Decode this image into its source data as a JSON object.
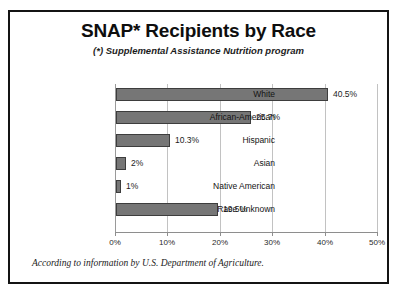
{
  "chart_data": {
    "type": "bar",
    "orientation": "horizontal",
    "title": "SNAP* Recipients by Race",
    "subtitle": "(*) Supplemental Assistance Nutrition program",
    "xlabel": "",
    "ylabel": "",
    "xlim": [
      0,
      50
    ],
    "grid": true,
    "legend": null,
    "categories": [
      "White",
      "African-American",
      "Hispanic",
      "Asian",
      "Native American",
      "Race Unknown"
    ],
    "values": [
      40.5,
      25.7,
      10.3,
      2,
      1,
      19.5
    ],
    "data_labels": [
      "40.5%",
      "25.7%",
      "10.3%",
      "2%",
      "1%",
      "19.5%"
    ],
    "xticks": [
      0,
      10,
      20,
      30,
      40,
      50
    ],
    "xtick_labels": [
      "0%",
      "10%",
      "20%",
      "30%",
      "40%",
      "50%"
    ],
    "bar_color": "#767676",
    "bar_border_color": "#3d3d3d",
    "gridline_color": "#c2c2c2",
    "axis_color": "#8e8e8e",
    "frame_color": "#141414",
    "background": "#ffffff",
    "annotation": "According to information by U.S. Department of Agriculture."
  }
}
